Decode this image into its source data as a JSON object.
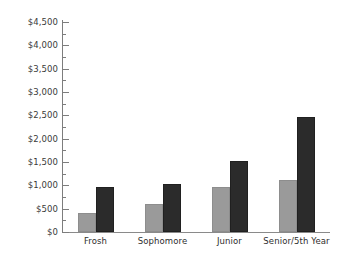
{
  "chart_data": {
    "type": "bar",
    "title": "",
    "subtitle": "",
    "xlabel": "",
    "ylabel": "",
    "categories": [
      "Frosh",
      "Sophomore",
      "Junior",
      "Senior/5th Year"
    ],
    "series": [
      {
        "name": "series-a",
        "color": "#9a9a9a",
        "values": [
          400,
          600,
          960,
          1115
        ]
      },
      {
        "name": "series-b",
        "color": "#2b2b2b",
        "values": [
          960,
          1030,
          1520,
          2460
        ]
      }
    ],
    "ylim": [
      0,
      4500
    ],
    "y_tick_step": 500,
    "y_minor_tick_step": 250,
    "y_tick_labels": [
      "$4,500",
      "$4,000",
      "$3,500",
      "$3,000",
      "$2,500",
      "$2,000",
      "$1,500",
      "$1,000",
      "$500",
      "$0"
    ],
    "y_tick_values": [
      4500,
      4000,
      3500,
      3000,
      2500,
      2000,
      1500,
      1000,
      500,
      0
    ],
    "grid": false,
    "legend": null,
    "legend_position": "none",
    "annotations": []
  },
  "axis": {
    "line_color": "#7d7d7d",
    "label_color": "#3a3a3a"
  }
}
